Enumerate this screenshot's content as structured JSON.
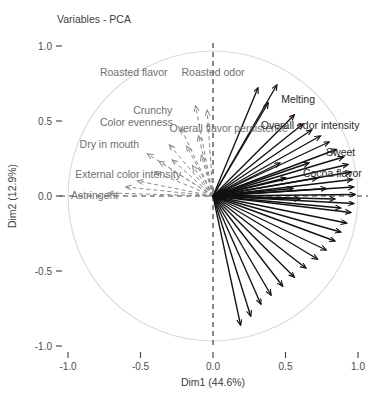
{
  "chart_data": {
    "type": "scatter",
    "title": "Variables - PCA",
    "xlabel": "Dim1 (44.6%)",
    "ylabel": "Dim2 (12.9%)",
    "xlim": [
      -1.15,
      1.15
    ],
    "ylim": [
      -1.15,
      1.15
    ],
    "xticks": [
      "-1.0",
      "-0.5",
      "0.0",
      "0.5",
      "1.0"
    ],
    "xtick_values": [
      -1.0,
      -0.5,
      0.0,
      0.5,
      1.0
    ],
    "yticks": [
      "1.0",
      "0.5",
      "0.0",
      "-0.5",
      "-1.0"
    ],
    "ytick_values": [
      1.0,
      0.5,
      0.0,
      -0.5,
      -1.0
    ],
    "grid": false,
    "legend": "none",
    "correlation_circle": true,
    "circle_radius": 1.0,
    "origin": [
      0.0,
      0.0
    ],
    "variance_explained": {
      "dim1": "44.6%",
      "dim2": "12.9%"
    },
    "annotations": [
      "Correlation circle of variables on PC1 x PC2"
    ],
    "vectors": [
      {
        "label": "Roasted flavor",
        "x": -0.12,
        "y": 0.6,
        "style": "dashed",
        "color": "#8a8a8a",
        "label_x": -0.78,
        "label_y": 0.8,
        "anchor": "start"
      },
      {
        "label": "Roasted odor",
        "x": -0.04,
        "y": 0.57,
        "style": "dashed",
        "color": "#8a8a8a",
        "label_x": 0.0,
        "label_y": 0.8,
        "anchor": "middle"
      },
      {
        "label": "Crunchy",
        "x": -0.22,
        "y": 0.45,
        "style": "dashed",
        "color": "#8a8a8a",
        "label_x": -0.55,
        "label_y": 0.55,
        "anchor": "start"
      },
      {
        "label": "Color evenness",
        "x": -0.3,
        "y": 0.34,
        "style": "dashed",
        "color": "#8a8a8a",
        "label_x": -0.78,
        "label_y": 0.47,
        "anchor": "start"
      },
      {
        "label": "Overall flavor persistence",
        "x": -0.1,
        "y": 0.4,
        "style": "dashed",
        "color": "#8a8a8a",
        "label_x": -0.3,
        "label_y": 0.43,
        "anchor": "start"
      },
      {
        "label": "Dry in mouth",
        "x": -0.37,
        "y": 0.23,
        "style": "dashed",
        "color": "#8a8a8a",
        "label_x": -0.92,
        "label_y": 0.32,
        "anchor": "start"
      },
      {
        "label": "External color intensity",
        "x": -0.52,
        "y": 0.1,
        "style": "dashed",
        "color": "#8a8a8a",
        "label_x": -0.95,
        "label_y": 0.12,
        "anchor": "start"
      },
      {
        "label": "Astringent",
        "x": -0.72,
        "y": 0.02,
        "style": "dashed",
        "color": "#8a8a8a",
        "label_x": -0.98,
        "label_y": -0.02,
        "anchor": "start"
      },
      {
        "label": "",
        "x": -0.45,
        "y": 0.28,
        "style": "dashed",
        "color": "#8a8a8a"
      },
      {
        "label": "",
        "x": -0.4,
        "y": 0.16,
        "style": "dashed",
        "color": "#8a8a8a"
      },
      {
        "label": "",
        "x": -0.28,
        "y": 0.24,
        "style": "dashed",
        "color": "#8a8a8a"
      },
      {
        "label": "",
        "x": -0.18,
        "y": 0.33,
        "style": "dashed",
        "color": "#8a8a8a"
      },
      {
        "label": "",
        "x": -0.6,
        "y": 0.06,
        "style": "dashed",
        "color": "#8a8a8a"
      },
      {
        "label": "",
        "x": -0.14,
        "y": 0.2,
        "style": "dashed",
        "color": "#8a8a8a"
      },
      {
        "label": "",
        "x": -0.08,
        "y": 0.27,
        "style": "dashed",
        "color": "#8a8a8a"
      },
      {
        "label": "Melting",
        "x": 0.44,
        "y": 0.74,
        "style": "solid",
        "color": "#111111",
        "label_x": 0.47,
        "label_y": 0.62,
        "anchor": "start"
      },
      {
        "label": "",
        "x": 0.31,
        "y": 0.72,
        "style": "solid",
        "color": "#111111"
      },
      {
        "label": "",
        "x": 0.38,
        "y": 0.62,
        "style": "solid",
        "color": "#111111"
      },
      {
        "label": "Overall odor intensity",
        "x": 0.56,
        "y": 0.54,
        "style": "solid",
        "color": "#111111",
        "label_x": 0.33,
        "label_y": 0.45,
        "anchor": "start"
      },
      {
        "label": "",
        "x": 0.62,
        "y": 0.48,
        "style": "solid",
        "color": "#111111"
      },
      {
        "label": "",
        "x": 0.68,
        "y": 0.44,
        "style": "solid",
        "color": "#111111"
      },
      {
        "label": "",
        "x": 0.74,
        "y": 0.4,
        "style": "solid",
        "color": "#111111"
      },
      {
        "label": "",
        "x": 0.8,
        "y": 0.36,
        "style": "solid",
        "color": "#111111"
      },
      {
        "label": "",
        "x": 0.85,
        "y": 0.31,
        "style": "solid",
        "color": "#111111"
      },
      {
        "label": "Sweet",
        "x": 0.9,
        "y": 0.26,
        "style": "solid",
        "color": "#111111",
        "label_x": 0.78,
        "label_y": 0.27,
        "anchor": "start"
      },
      {
        "label": "",
        "x": 0.93,
        "y": 0.21,
        "style": "solid",
        "color": "#111111"
      },
      {
        "label": "Cocoa flavor",
        "x": 0.95,
        "y": 0.16,
        "style": "solid",
        "color": "#111111",
        "label_x": 0.62,
        "label_y": 0.13,
        "anchor": "start"
      },
      {
        "label": "",
        "x": 0.96,
        "y": 0.11,
        "style": "solid",
        "color": "#111111"
      },
      {
        "label": "",
        "x": 0.97,
        "y": 0.06,
        "style": "solid",
        "color": "#111111"
      },
      {
        "label": "",
        "x": 0.98,
        "y": 0.01,
        "style": "solid",
        "color": "#111111"
      },
      {
        "label": "",
        "x": 0.97,
        "y": -0.05,
        "style": "solid",
        "color": "#111111"
      },
      {
        "label": "",
        "x": 0.95,
        "y": -0.11,
        "style": "solid",
        "color": "#111111"
      },
      {
        "label": "",
        "x": 0.92,
        "y": -0.18,
        "style": "solid",
        "color": "#111111"
      },
      {
        "label": "",
        "x": 0.88,
        "y": -0.24,
        "style": "solid",
        "color": "#111111"
      },
      {
        "label": "",
        "x": 0.84,
        "y": -0.3,
        "style": "solid",
        "color": "#111111"
      },
      {
        "label": "",
        "x": 0.78,
        "y": -0.36,
        "style": "solid",
        "color": "#111111"
      },
      {
        "label": "",
        "x": 0.72,
        "y": -0.42,
        "style": "solid",
        "color": "#111111"
      },
      {
        "label": "",
        "x": 0.64,
        "y": -0.48,
        "style": "solid",
        "color": "#111111"
      },
      {
        "label": "",
        "x": 0.56,
        "y": -0.54,
        "style": "solid",
        "color": "#111111"
      },
      {
        "label": "",
        "x": 0.48,
        "y": -0.6,
        "style": "solid",
        "color": "#111111"
      },
      {
        "label": "",
        "x": 0.4,
        "y": -0.66,
        "style": "solid",
        "color": "#111111"
      },
      {
        "label": "",
        "x": 0.33,
        "y": -0.72,
        "style": "solid",
        "color": "#111111"
      },
      {
        "label": "",
        "x": 0.26,
        "y": -0.8,
        "style": "solid",
        "color": "#111111"
      },
      {
        "label": "",
        "x": 0.19,
        "y": -0.86,
        "style": "solid",
        "color": "#111111"
      },
      {
        "label": "",
        "x": 0.5,
        "y": 0.12,
        "style": "solid",
        "color": "#111111"
      },
      {
        "label": "",
        "x": 0.55,
        "y": 0.05,
        "style": "solid",
        "color": "#111111"
      },
      {
        "label": "",
        "x": 0.6,
        "y": -0.02,
        "style": "solid",
        "color": "#111111"
      },
      {
        "label": "",
        "x": 0.46,
        "y": 0.22,
        "style": "solid",
        "color": "#111111"
      },
      {
        "label": "",
        "x": 0.66,
        "y": 0.22,
        "style": "solid",
        "color": "#111111"
      },
      {
        "label": "",
        "x": 0.72,
        "y": 0.12,
        "style": "solid",
        "color": "#111111"
      },
      {
        "label": "",
        "x": 0.78,
        "y": 0.05,
        "style": "solid",
        "color": "#111111"
      },
      {
        "label": "",
        "x": 0.84,
        "y": -0.02,
        "style": "solid",
        "color": "#111111"
      },
      {
        "label": "",
        "x": 0.88,
        "y": -0.08,
        "style": "solid",
        "color": "#111111"
      }
    ]
  }
}
